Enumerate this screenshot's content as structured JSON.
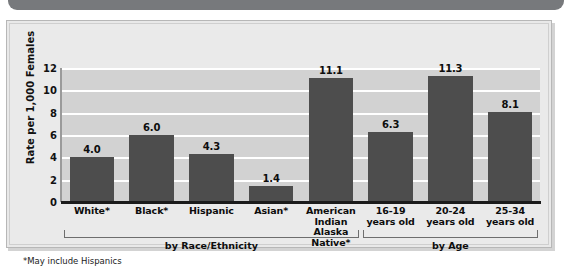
{
  "banner": {
    "name": "top-banner-strip",
    "color": "#77797c"
  },
  "footnote": "*May include Hispanics",
  "chart_data": {
    "type": "bar",
    "title": "",
    "subtitle": "",
    "xlabel": "",
    "ylabel": "Rate per 1,000 Females",
    "ylim": [
      0,
      12
    ],
    "yticks": [
      "0",
      "2",
      "4",
      "6",
      "8",
      "10",
      "12"
    ],
    "ytick_values": [
      0,
      2,
      4,
      6,
      8,
      10,
      12
    ],
    "grid": true,
    "grid_color": "#ffffff",
    "plot_background": "#d2d2d2",
    "bar_color": "#4d4d4d",
    "legend": "none",
    "categories": [
      "White*",
      "Black*",
      "Hispanic",
      "Asian*",
      "American Indian\nAlaska Native*",
      "16-19\nyears old",
      "20-24\nyears old",
      "25-34\nyears old"
    ],
    "category_lines": [
      [
        "White*"
      ],
      [
        "Black*"
      ],
      [
        "Hispanic"
      ],
      [
        "Asian*"
      ],
      [
        "American Indian",
        "Alaska Native*"
      ],
      [
        "16-19",
        "years old"
      ],
      [
        "20-24",
        "years old"
      ],
      [
        "25-34",
        "years old"
      ]
    ],
    "values": [
      4.0,
      6.0,
      4.3,
      1.4,
      11.1,
      6.3,
      11.3,
      8.1
    ],
    "value_labels": [
      "4.0",
      "6.0",
      "4.3",
      "1.4",
      "11.1",
      "6.3",
      "11.3",
      "8.1"
    ],
    "groups": [
      {
        "label": "by Race/Ethnicity",
        "start_index": 0,
        "end_index": 4
      },
      {
        "label": "by Age",
        "start_index": 5,
        "end_index": 7
      }
    ],
    "annotations": [
      "*May include Hispanics"
    ]
  }
}
